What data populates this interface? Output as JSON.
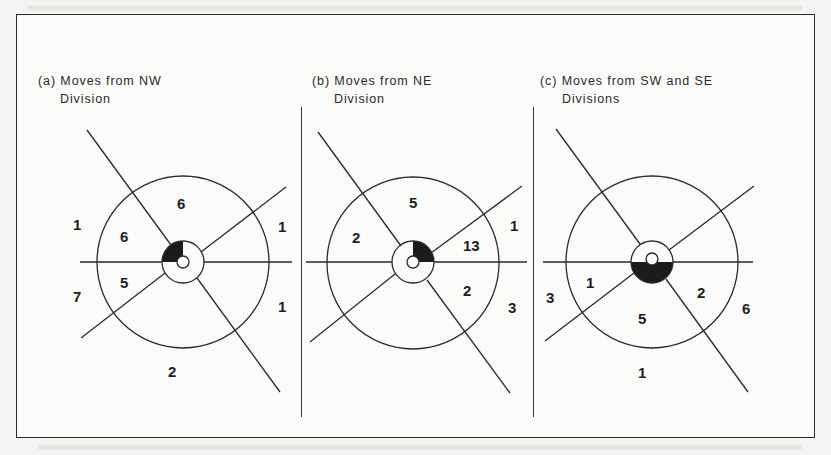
{
  "figure": {
    "ink_color": "#2a2a2a",
    "shade_color": "#1b1b1b",
    "paper_color": "#fbfbfa"
  },
  "panels": [
    {
      "id": "a",
      "title_line1": "(a) Moves from NW",
      "title_line2": "Division",
      "origin_division": "NW",
      "shaded_sector": "NW quadrant",
      "counts": {
        "inner_north": "6",
        "inner_west_upper": "6",
        "inner_west_lower": "5",
        "outer_west_upper": "1",
        "outer_west_lower": "7",
        "outer_east_upper": "1",
        "outer_east_lower": "1",
        "outer_south": "2"
      }
    },
    {
      "id": "b",
      "title_line1": "(b) Moves from NE",
      "title_line2": "Division",
      "origin_division": "NE",
      "shaded_sector": "NE quadrant",
      "counts": {
        "inner_north": "5",
        "inner_west_upper": "2",
        "inner_east_upper": "13",
        "inner_east_lower": "2",
        "outer_east_upper": "1",
        "outer_east_lower": "3"
      }
    },
    {
      "id": "c",
      "title_line1": "(c) Moves from SW and SE",
      "title_line2": "Divisions",
      "origin_division": "SW and SE",
      "shaded_sector": "southern half",
      "counts": {
        "inner_west_lower": "1",
        "inner_south": "5",
        "inner_east_lower": "2",
        "outer_west_lower": "3",
        "outer_east_lower": "6",
        "outer_south": "1"
      }
    }
  ]
}
